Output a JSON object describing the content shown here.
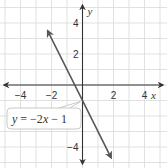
{
  "chart_data": {
    "type": "line",
    "title": "",
    "xlabel": "x",
    "ylabel": "y",
    "xlim": [
      -5,
      5
    ],
    "ylim": [
      -5,
      5
    ],
    "grid": true,
    "x_ticks": [
      -4,
      -2,
      2,
      4
    ],
    "y_ticks": [
      4,
      2,
      -4
    ],
    "x_tick_labels": [
      "−4",
      "−2",
      "2",
      "4"
    ],
    "y_tick_labels": [
      "4",
      "2",
      "−4"
    ],
    "series": [
      {
        "name": "y = −2x − 1",
        "slope": -2,
        "intercept": -1,
        "x": [
          -2.25,
          1.85
        ],
        "y": [
          3.5,
          -4.7
        ],
        "color": "#555555",
        "arrows": "both"
      }
    ],
    "annotations": [
      {
        "text_parts": [
          "y",
          " = −2",
          "x",
          " − 1"
        ],
        "points_to": [
          0,
          -1
        ],
        "placement": "lower-left"
      }
    ]
  }
}
